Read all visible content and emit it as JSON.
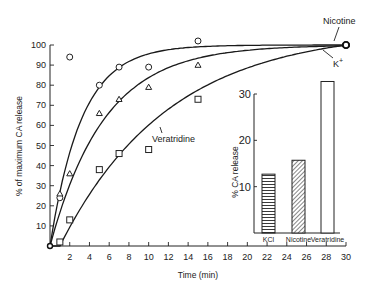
{
  "chart_data": [
    {
      "type": "scatter",
      "title": "",
      "xlabel": "Time (min)",
      "ylabel": "% of maximum CA release",
      "xlim": [
        0,
        30
      ],
      "ylim": [
        0,
        100
      ],
      "xticks": [
        2,
        4,
        6,
        8,
        10,
        12,
        14,
        16,
        18,
        20,
        22,
        24,
        26,
        28,
        30
      ],
      "yticks": [
        10,
        20,
        30,
        40,
        50,
        60,
        70,
        80,
        90,
        100
      ],
      "grid": false,
      "series": [
        {
          "name": "Nicotine",
          "marker": "circle",
          "x": [
            0,
            1,
            2,
            5,
            7,
            10,
            15,
            30
          ],
          "y": [
            0,
            24,
            94,
            80,
            89,
            89,
            102,
            100
          ]
        },
        {
          "name": "K+",
          "marker": "triangle",
          "x": [
            0,
            1,
            2,
            5,
            7,
            10,
            15,
            30
          ],
          "y": [
            0,
            26,
            36,
            66,
            73,
            79,
            90,
            100
          ]
        },
        {
          "name": "Veratridine",
          "marker": "square",
          "x": [
            0,
            1,
            2,
            5,
            7,
            10,
            15,
            30
          ],
          "y": [
            0,
            2,
            13,
            38,
            46,
            48,
            73,
            100
          ]
        }
      ],
      "annotations": [
        "Nicotine",
        "K+",
        "Veratridine"
      ]
    },
    {
      "type": "bar",
      "title": "",
      "xlabel": "",
      "ylabel": "% CA release",
      "categories": [
        "KCl",
        "Nicotine",
        "Veratridine"
      ],
      "values": [
        12.7,
        15.7,
        32.7
      ],
      "yticks": [
        10,
        20,
        30
      ],
      "ylim": [
        0,
        35
      ],
      "patterns": [
        "horizontal-lines",
        "diagonal-hatch",
        "empty"
      ]
    }
  ],
  "labels": {
    "xlabel": "Time (min)",
    "ylabel": "% of maximum CA release",
    "nicotine": "Nicotine",
    "kplus": "K",
    "kplus_sup": "+",
    "veratridine": "Veratridine",
    "inset_ylabel": "% CA release",
    "inset_cats": [
      "KCl",
      "Nicotine",
      "Veratridine"
    ]
  }
}
